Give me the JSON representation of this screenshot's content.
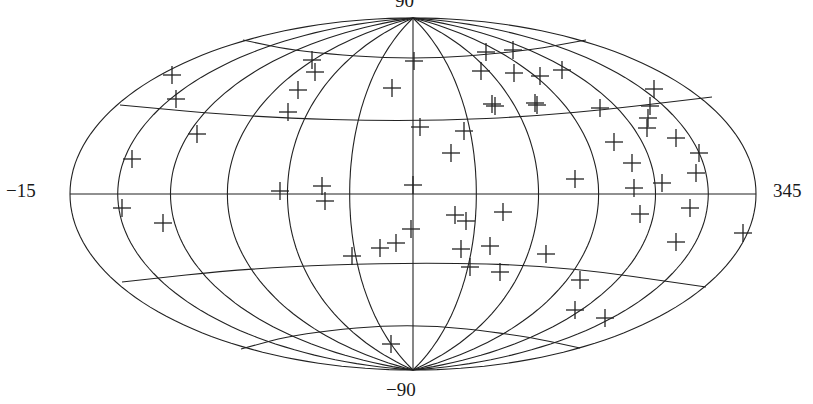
{
  "chart_data": {
    "type": "scatter",
    "projection": "Hammer-Aitoff (all-sky)",
    "title": "",
    "labels": {
      "top": "90",
      "bottom": "−90",
      "left": "−15",
      "right": "345"
    },
    "grid": {
      "on": true,
      "meridian_step_deg": 30,
      "parallels_deg": [
        -60,
        -30,
        0,
        30,
        60
      ],
      "longitude_range": [
        -15,
        345
      ],
      "latitude_range": [
        -90,
        90
      ]
    },
    "marker": "plus",
    "marker_color": "#222222",
    "line_color": "#222222",
    "points_px": [
      [
        172,
        75
      ],
      [
        176,
        99
      ],
      [
        197,
        134
      ],
      [
        132,
        159
      ],
      [
        122,
        208
      ],
      [
        163,
        223
      ],
      [
        312,
        60
      ],
      [
        315,
        72
      ],
      [
        298,
        90
      ],
      [
        288,
        112
      ],
      [
        280,
        191
      ],
      [
        322,
        186
      ],
      [
        325,
        201
      ],
      [
        392,
        88
      ],
      [
        414,
        61
      ],
      [
        420,
        127
      ],
      [
        413,
        185
      ],
      [
        411,
        229
      ],
      [
        396,
        243
      ],
      [
        380,
        248
      ],
      [
        352,
        256
      ],
      [
        391,
        344
      ],
      [
        486,
        52
      ],
      [
        513,
        50
      ],
      [
        481,
        71
      ],
      [
        514,
        73
      ],
      [
        540,
        76
      ],
      [
        562,
        70
      ],
      [
        492,
        104
      ],
      [
        495,
        106
      ],
      [
        535,
        103
      ],
      [
        537,
        105
      ],
      [
        464,
        131
      ],
      [
        451,
        153
      ],
      [
        600,
        108
      ],
      [
        654,
        89
      ],
      [
        650,
        106
      ],
      [
        648,
        118
      ],
      [
        647,
        128
      ],
      [
        614,
        142
      ],
      [
        676,
        138
      ],
      [
        699,
        153
      ],
      [
        696,
        173
      ],
      [
        632,
        163
      ],
      [
        662,
        183
      ],
      [
        634,
        188
      ],
      [
        575,
        179
      ],
      [
        690,
        208
      ],
      [
        640,
        214
      ],
      [
        676,
        242
      ],
      [
        743,
        233
      ],
      [
        455,
        215
      ],
      [
        466,
        221
      ],
      [
        503,
        212
      ],
      [
        461,
        249
      ],
      [
        470,
        267
      ],
      [
        490,
        246
      ],
      [
        500,
        272
      ],
      [
        546,
        254
      ],
      [
        580,
        280
      ],
      [
        575,
        310
      ],
      [
        605,
        318
      ]
    ]
  }
}
